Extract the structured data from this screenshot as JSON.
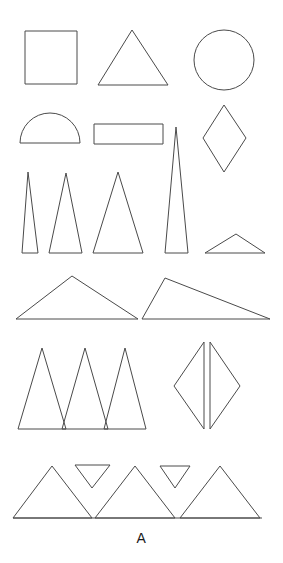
{
  "figure": {
    "panel_label": "A",
    "stroke_color": "#4a4a4a",
    "background_color": "#ffffff",
    "width": 283,
    "height": 563
  },
  "chart_data": {
    "type": "diagram",
    "title": "",
    "subtitle": "",
    "xlabel": "",
    "ylabel": "",
    "grid": false,
    "legend": "none",
    "rows": [
      {
        "row": 1,
        "name": "basic-shapes",
        "shapes": [
          {
            "name": "square",
            "type": "rect",
            "x": 25,
            "y": 31,
            "width": 52,
            "height": 53
          },
          {
            "name": "equilateral-triangle",
            "type": "polygon",
            "points": "132,30 168,85 98,85"
          },
          {
            "name": "circle",
            "type": "circle",
            "cx": 224,
            "cy": 60,
            "r": 30
          }
        ]
      },
      {
        "row": 2,
        "name": "semicircle-rectangle-diamond",
        "shapes": [
          {
            "name": "semicircle",
            "type": "path",
            "d": "M 20 143 A 30 30 0 0 1 80 143 Z"
          },
          {
            "name": "rectangle",
            "type": "rect",
            "x": 94,
            "y": 124,
            "width": 69,
            "height": 20
          },
          {
            "name": "diamond",
            "type": "polygon",
            "points": "224,105 246,138 224,172 203,138"
          }
        ]
      },
      {
        "row": 3,
        "name": "narrow-to-wide-triangles",
        "shapes": [
          {
            "name": "narrow-triangle-1",
            "type": "polygon",
            "points": "28,172 38,253 22,253"
          },
          {
            "name": "narrow-triangle-2",
            "type": "polygon",
            "points": "66,173 82,253 49,253"
          },
          {
            "name": "narrow-triangle-3",
            "type": "polygon",
            "points": "118,172 143,253 93,253"
          },
          {
            "name": "spike-triangle",
            "type": "polygon",
            "points": "176,127 188,253 165,253"
          },
          {
            "name": "flat-triangle",
            "type": "polygon",
            "points": "236,234 265,253 205,253"
          }
        ]
      },
      {
        "row": 4,
        "name": "obtuse-triangles",
        "shapes": [
          {
            "name": "obtuse-triangle-left",
            "type": "polygon",
            "points": "72,276 138,319 16,319"
          },
          {
            "name": "obtuse-triangle-right",
            "type": "polygon",
            "points": "165,278 270,319 142,319"
          }
        ]
      },
      {
        "row": 5,
        "name": "zigzag-and-mirrored-triangles",
        "shapes": [
          {
            "name": "zigzag-triangle-1",
            "type": "polygon",
            "points": "42,348 66,429 18,429"
          },
          {
            "name": "zigzag-triangle-2",
            "type": "polygon",
            "points": "85,348 108,429 62,429"
          },
          {
            "name": "zigzag-triangle-3",
            "type": "polygon",
            "points": "125,348 146,429 104,429"
          },
          {
            "name": "mirrored-triangle-left",
            "type": "polygon",
            "points": "204,342 204,429 174,386"
          },
          {
            "name": "mirrored-triangle-right",
            "type": "polygon",
            "points": "210,342 240,386 210,429"
          }
        ]
      },
      {
        "row": 6,
        "name": "tessellation-strip",
        "shapes": [
          {
            "name": "baseline",
            "type": "line",
            "x1": 13,
            "y1": 518,
            "x2": 262,
            "y2": 518
          },
          {
            "name": "up-triangle-1",
            "type": "polygon",
            "points": "52,466 92,518 13,518"
          },
          {
            "name": "up-triangle-2",
            "type": "polygon",
            "points": "135,466 175,518 95,518"
          },
          {
            "name": "up-triangle-3",
            "type": "polygon",
            "points": "220,466 260,518 180,518"
          },
          {
            "name": "down-triangle-1",
            "type": "polygon",
            "points": "75,465 110,465 92,488"
          },
          {
            "name": "down-triangle-2",
            "type": "polygon",
            "points": "160,466 190,466 175,488"
          }
        ]
      }
    ]
  }
}
